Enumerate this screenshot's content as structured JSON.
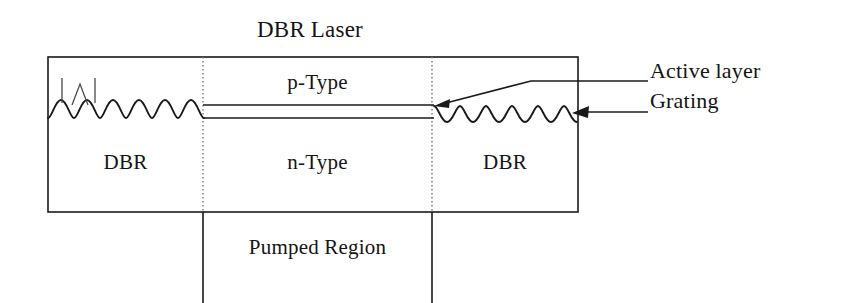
{
  "diagram": {
    "title": "DBR Laser",
    "regions": {
      "dbr_left": "DBR",
      "dbr_right": "DBR",
      "p_type": "p-Type",
      "n_type": "n-Type",
      "pumped_region": "Pumped Region"
    },
    "callouts": {
      "active_layer": "Active layer",
      "grating": "Grating"
    },
    "colors": {
      "stroke": "#1a1a1a",
      "divider": "#6e6e6e",
      "background": "#ffffff",
      "text": "#141414"
    },
    "geometry": {
      "body_left": 48,
      "body_right": 578,
      "body_top": 57,
      "body_bottom": 212,
      "divider_left_x": 203,
      "divider_right_x": 432,
      "active_layer_top_y": 105,
      "active_layer_bottom_y": 118,
      "grating_periods_left": 6,
      "grating_periods_right": 6
    }
  }
}
